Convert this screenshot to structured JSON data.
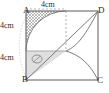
{
  "figure": {
    "shape": "square",
    "vertices": {
      "top_left": "A",
      "top_right": "D",
      "bottom_left": "B",
      "bottom_right": "C"
    },
    "dimensions": {
      "top_label": "4cm",
      "left_upper_label": "4cm",
      "left_lower_label": "4cm"
    },
    "colors": {
      "stroke": "#5a5a5a",
      "label": "#2b2b2b",
      "hatch": "#7a7a7a",
      "shade_fill": "#d9d9d9",
      "dashed": "#9a9a9a"
    },
    "annotations": {
      "hatched_region": "cross-hatched region near vertex A",
      "shaded_region": "shaded triangle near vertex B",
      "marker": "small ellipse marker inside shaded triangle",
      "dashed_line": "vertical dashed line from top edge midpoint to centre"
    }
  }
}
